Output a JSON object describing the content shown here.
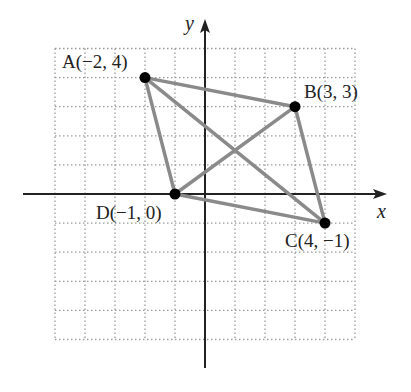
{
  "figure": {
    "type": "coordinate-plane-quadrilateral",
    "x_axis_label": "x",
    "y_axis_label": "y",
    "grid": {
      "x_min": -5,
      "x_max": 5,
      "y_min": -5,
      "y_max": 5,
      "style": "dotted"
    },
    "points": [
      {
        "name": "A",
        "x": -2,
        "y": 4,
        "label": "A(−2, 4)"
      },
      {
        "name": "B",
        "x": 3,
        "y": 3,
        "label": "B(3, 3)"
      },
      {
        "name": "C",
        "x": 4,
        "y": -1,
        "label": "C(4, −1)"
      },
      {
        "name": "D",
        "x": -1,
        "y": 0,
        "label": "D(−1, 0)"
      }
    ],
    "segments": [
      [
        "A",
        "B"
      ],
      [
        "B",
        "C"
      ],
      [
        "C",
        "D"
      ],
      [
        "D",
        "A"
      ],
      [
        "A",
        "C"
      ],
      [
        "B",
        "D"
      ]
    ],
    "colors": {
      "segment": "#8a8a8a",
      "point": "#000000",
      "axis": "#222222",
      "grid": "#9a9a9a"
    }
  }
}
